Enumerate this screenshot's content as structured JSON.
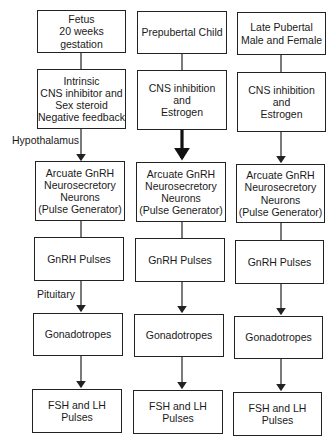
{
  "diagram": {
    "side_labels": {
      "hypothalamus": "Hypothalamus",
      "pituitary": "Pituitary"
    },
    "columns": [
      {
        "name": "fetus",
        "boxes": [
          "Fetus\n20 weeks gestation",
          "Intrinsic\nCNS inhibitor and\nSex steroid\nNegative feedback",
          "Arcuate GnRH\nNeurosecretory\nNeurons\n(Pulse Generator)",
          "GnRH Pulses",
          "Gonadotropes",
          "FSH and LH\nPulses"
        ]
      },
      {
        "name": "prepubertal-child",
        "boxes": [
          "Prepubertal Child",
          "CNS inhibition\nand\nEstrogen",
          "Arcuate GnRH\nNeurosecretory\nNeurons\n(Pulse Generator)",
          "GnRH Pulses",
          "Gonadotropes",
          "FSH and LH\nPulses"
        ]
      },
      {
        "name": "late-pubertal",
        "boxes": [
          "Late Pubertal\nMale and Female",
          "CNS inhibition\nand\nEstrogen",
          "Arcuate GnRH\nNeurosecretory\nNeurons\n(Pulse Generator)",
          "GnRH Pulses",
          "Gonadotropes",
          "FSH and LH\nPulses"
        ]
      }
    ],
    "notes": {
      "thick_arrow": "Prepubertal Child: CNS inhibition to Arcuate GnRH drawn with bold (thick) inhibitory arrow"
    }
  }
}
